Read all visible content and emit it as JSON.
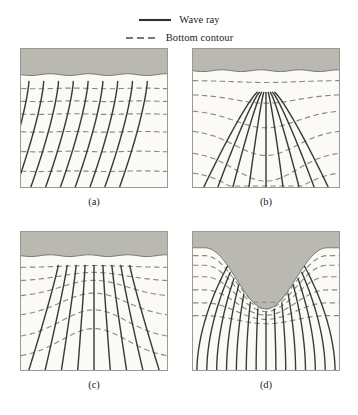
{
  "figure": {
    "background_color": "#ffffff"
  },
  "legend": {
    "items": [
      {
        "label": "Wave ray",
        "style": "solid",
        "color": "#2f2f2d",
        "icon": "solid-line-icon"
      },
      {
        "label": "Bottom contour",
        "style": "dashed",
        "color": "#6f6f68",
        "icon": "dashed-line-icon"
      }
    ]
  },
  "colors": {
    "land": "#b9b9b1",
    "water": "#fbfaf7",
    "ray": "#3a3a38",
    "contour": "#8a8a82",
    "border": "#9a9a92",
    "shoreline": "#6f6f68"
  },
  "panels": [
    {
      "id": "a",
      "caption": "(a)",
      "name": "straight-shoreline-panel",
      "description": "Waves approaching a straight shoreline obliquely; rays refract toward shore-normal",
      "topography": "straight parallel contours",
      "land": {
        "type": "band",
        "depth": 26
      },
      "contours": [
        {
          "type": "straight",
          "y": 40
        },
        {
          "type": "straight",
          "y": 53
        },
        {
          "type": "straight",
          "y": 66
        },
        {
          "type": "straight",
          "y": 84
        },
        {
          "type": "straight",
          "y": 104
        },
        {
          "type": "straight",
          "y": 124
        }
      ],
      "rays": {
        "count": 9,
        "pattern": "oblique-refracting",
        "top_spacing": 15,
        "bottom_offset": -26,
        "start_x": 8,
        "start_y": 33
      }
    },
    {
      "id": "b",
      "caption": "(b)",
      "name": "submarine-canyon-panel",
      "description": "Waves over a submarine canyon; rays diverge away from the canyon axis",
      "topography": "contours dip seaward (V) over canyon",
      "land": {
        "type": "band",
        "depth": 22
      },
      "contours": [
        {
          "type": "valley",
          "y": 32,
          "amp": 2
        },
        {
          "type": "valley",
          "y": 46,
          "amp": 9
        },
        {
          "type": "valley",
          "y": 62,
          "amp": 18
        },
        {
          "type": "valley",
          "y": 82,
          "amp": 26
        },
        {
          "type": "valley",
          "y": 104,
          "amp": 30
        },
        {
          "type": "valley",
          "y": 124,
          "amp": 30
        }
      ],
      "rays": {
        "count": 9,
        "pattern": "diverging",
        "center_x": 74,
        "start_y": 44,
        "spread": 1.45
      }
    },
    {
      "id": "c",
      "caption": "(c)",
      "name": "submarine-ridge-panel",
      "description": "Waves over a submarine ridge or shoal; rays converge toward the ridge crest",
      "topography": "contours arch shoreward over ridge",
      "land": {
        "type": "band",
        "depth": 24
      },
      "contours": [
        {
          "type": "ridge",
          "y": 36,
          "amp": 2
        },
        {
          "type": "ridge",
          "y": 50,
          "amp": 9
        },
        {
          "type": "ridge",
          "y": 66,
          "amp": 17
        },
        {
          "type": "ridge",
          "y": 86,
          "amp": 24
        },
        {
          "type": "ridge",
          "y": 108,
          "amp": 29
        },
        {
          "type": "ridge",
          "y": 128,
          "amp": 30
        }
      ],
      "rays": {
        "count": 9,
        "pattern": "converging",
        "center_x": 74,
        "start_y": 34,
        "squeeze": 0.55
      }
    },
    {
      "id": "d",
      "caption": "(d)",
      "name": "bay-headland-panel",
      "description": "Waves entering a bay between two headlands; rays converge into the bay apex",
      "topography": "nested U-shaped contours following the bay",
      "land": {
        "type": "bay",
        "shoulder": 16,
        "apex_y": 78,
        "half_width": 26
      },
      "contours": [
        {
          "type": "bay",
          "offset": 8
        },
        {
          "type": "bay",
          "offset": 18
        },
        {
          "type": "bay",
          "offset": 30
        },
        {
          "type": "bay",
          "offset": 44
        },
        {
          "type": "bay",
          "offset": 58
        },
        {
          "type": "bay",
          "offset": 72
        }
      ],
      "rays": {
        "count": 15,
        "pattern": "bay-converging",
        "center_x": 74,
        "focus_y": 86
      }
    }
  ]
}
